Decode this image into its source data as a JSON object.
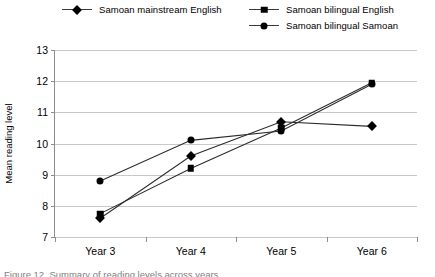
{
  "chart_data": {
    "type": "line",
    "title": "",
    "xlabel": "",
    "ylabel": "Mean reading level",
    "categories": [
      "Year 3",
      "Year 4",
      "Year 5",
      "Year 6"
    ],
    "ylim": [
      7,
      13
    ],
    "yticks": [
      7,
      8,
      9,
      10,
      11,
      12,
      13
    ],
    "grid": true,
    "legend_position": "top",
    "series": [
      {
        "name": "Samoan mainstream English",
        "marker": "diamond",
        "color": "#000000",
        "values": [
          7.6,
          9.6,
          10.7,
          10.55
        ]
      },
      {
        "name": "Samoan bilingual English",
        "marker": "square",
        "color": "#000000",
        "values": [
          7.75,
          9.2,
          10.5,
          11.95
        ]
      },
      {
        "name": "Samoan bilingual Samoan",
        "marker": "circle",
        "color": "#000000",
        "values": [
          8.8,
          10.1,
          10.4,
          11.9
        ]
      }
    ]
  },
  "axis": {
    "y_title": "Mean reading level",
    "y_tick_labels": [
      "13",
      "12",
      "11",
      "10",
      "9",
      "8",
      "7"
    ],
    "x_tick_labels": [
      "Year 3",
      "Year 4",
      "Year 5",
      "Year 6"
    ]
  },
  "legend": {
    "entries": [
      {
        "label": "Samoan mainstream English",
        "marker": "diamond"
      },
      {
        "label": "Samoan bilingual English",
        "marker": "square"
      },
      {
        "label": "Samoan bilingual Samoan",
        "marker": "circle"
      }
    ]
  },
  "caption": {
    "text": "Figure 12. Summary of reading levels across years"
  },
  "colors": {
    "series": "#000000",
    "gridline": "#c9c9c9",
    "axis": "#8d8d8d",
    "line": "#2b2b2b"
  }
}
